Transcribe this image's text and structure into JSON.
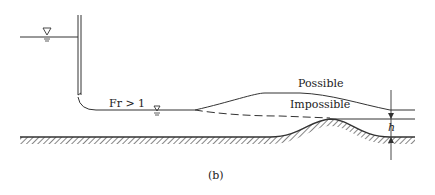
{
  "figure": {
    "caption": "(b)",
    "labels": {
      "froude": "Fr > 1",
      "possible": "Possible",
      "impossible": "Impossible",
      "bump_height": "h"
    },
    "colors": {
      "line": "#333333",
      "hatch": "#444444",
      "background": "#ffffff"
    },
    "icons": [
      "water-surface-triangle-upstream",
      "water-surface-triangle-downstream"
    ]
  }
}
